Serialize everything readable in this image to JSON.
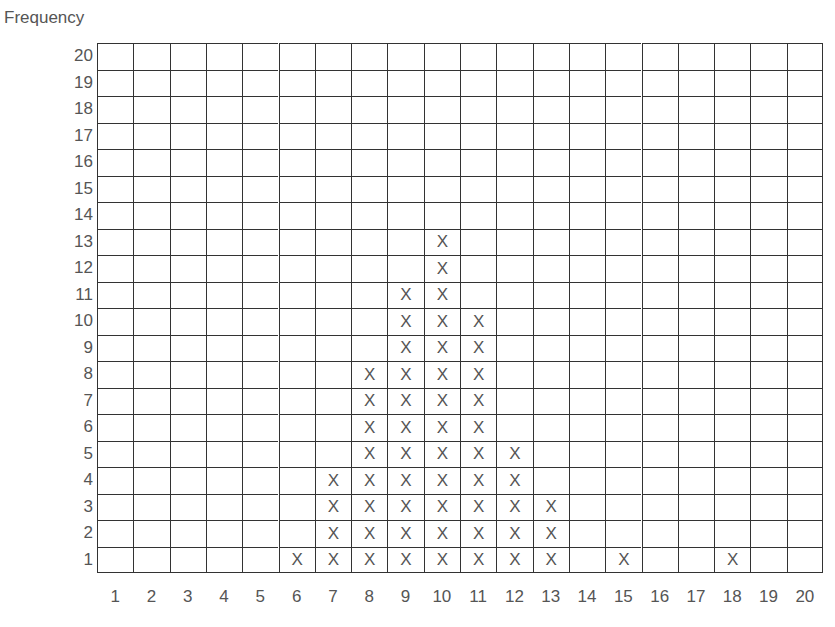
{
  "chart_data": {
    "type": "dot-plot",
    "title": "",
    "ylabel": "Frequency",
    "xlabel": "",
    "marker": "X",
    "categories": [
      1,
      2,
      3,
      4,
      5,
      6,
      7,
      8,
      9,
      10,
      11,
      12,
      13,
      14,
      15,
      16,
      17,
      18,
      19,
      20
    ],
    "values": [
      0,
      0,
      0,
      0,
      0,
      1,
      4,
      8,
      11,
      13,
      10,
      5,
      3,
      0,
      1,
      0,
      0,
      1,
      0,
      0
    ],
    "xlim": [
      1,
      20
    ],
    "ylim": [
      1,
      20
    ],
    "yticks": [
      1,
      2,
      3,
      4,
      5,
      6,
      7,
      8,
      9,
      10,
      11,
      12,
      13,
      14,
      15,
      16,
      17,
      18,
      19,
      20
    ],
    "xticks": [
      1,
      2,
      3,
      4,
      5,
      6,
      7,
      8,
      9,
      10,
      11,
      12,
      13,
      14,
      15,
      16,
      17,
      18,
      19,
      20
    ],
    "grid": true,
    "legend": null
  },
  "labels": {
    "frequency": "Frequency"
  }
}
